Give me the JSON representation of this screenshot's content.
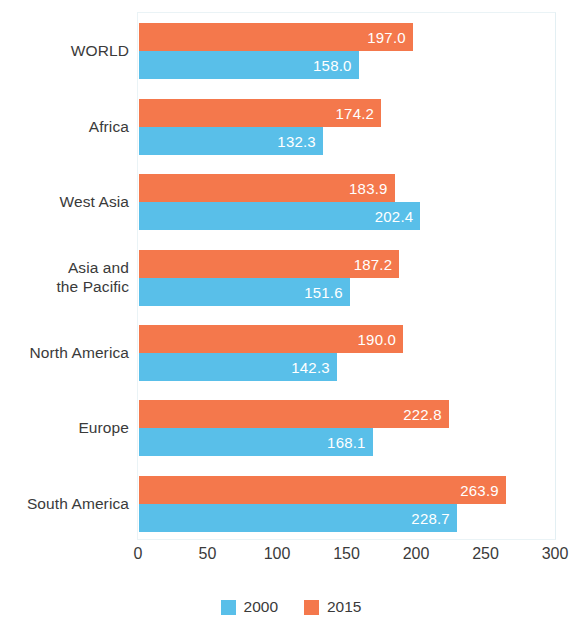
{
  "chart_data": {
    "type": "bar",
    "orientation": "horizontal",
    "title": "",
    "subtitle": "",
    "xlabel": "",
    "ylabel": "",
    "xlim": [
      0,
      300
    ],
    "xticks": [
      0,
      50,
      100,
      150,
      200,
      250,
      300
    ],
    "xtick_labels": [
      "0",
      "50",
      "100",
      "150",
      "200",
      "250",
      "300"
    ],
    "grid": false,
    "legend_position": "bottom",
    "categories": [
      "WORLD",
      "Africa",
      "West Asia",
      "Asia and\nthe Pacific",
      "North America",
      "Europe",
      "South America"
    ],
    "series": [
      {
        "name": "2000",
        "color": "#59bfe9",
        "values": [
          158.0,
          132.3,
          202.4,
          151.6,
          142.3,
          168.1,
          228.7
        ],
        "value_labels": [
          "158.0",
          "132.3",
          "202.4",
          "151.6",
          "142.3",
          "168.1",
          "228.7"
        ]
      },
      {
        "name": "2015",
        "color": "#f4784c",
        "values": [
          197.0,
          174.2,
          183.9,
          187.2,
          190.0,
          222.8,
          263.9
        ],
        "value_labels": [
          "197.0",
          "174.2",
          "183.9",
          "187.2",
          "190.0",
          "222.8",
          "263.9"
        ]
      }
    ]
  },
  "legend": {
    "items": [
      {
        "label": "2000",
        "color": "#59bfe9"
      },
      {
        "label": "2015",
        "color": "#f4784c"
      }
    ]
  },
  "colors": {
    "series_2000": "#59bfe9",
    "series_2015": "#f4784c",
    "text": "#3a3a3a",
    "value_label": "#ffffff",
    "plot_border": "#eaf3f6",
    "background": "#ffffff"
  }
}
